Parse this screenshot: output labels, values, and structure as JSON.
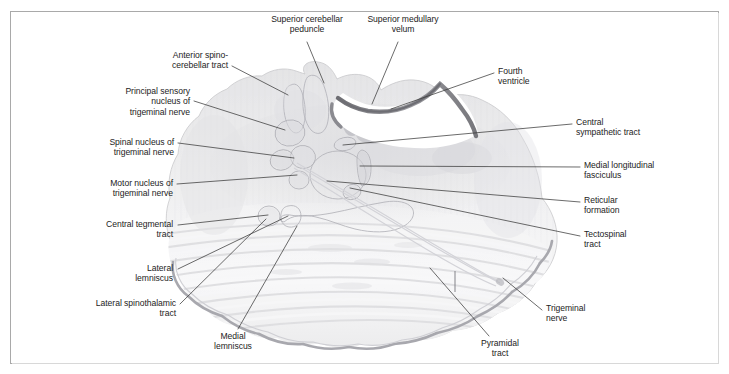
{
  "figure": {
    "frame_color": "#a9a9a9",
    "text_color": "#232323",
    "leader_color": "#3a3a3a",
    "tissue_fill": "#ededee",
    "tissue_stroke": "#c6c6c8",
    "ventricle_fill": "#ffffff",
    "velum_color": "#8e8e92"
  },
  "labels": [
    {
      "id": "superior-cerebellar-peduncle",
      "text": "Superior cerebellar\npeduncle",
      "align": "centered",
      "x": 248,
      "y": 14,
      "w": 118,
      "leader": [
        [
          307,
          42
        ],
        [
          324,
          83
        ]
      ]
    },
    {
      "id": "superior-medullary-velum",
      "text": "Superior medullary\nvelum",
      "align": "centered",
      "x": 345,
      "y": 14,
      "w": 116,
      "leader": [
        [
          398,
          42
        ],
        [
          372,
          104
        ]
      ]
    },
    {
      "id": "anterior-spinocerebellar-tract",
      "text": "Anterior spino-\ncerebellar tract",
      "align": "left-of-line",
      "x": 128,
      "y": 50,
      "w": 100,
      "leader": [
        [
          232,
          66
        ],
        [
          288,
          95
        ]
      ]
    },
    {
      "id": "fourth-ventricle",
      "text": "Fourth\nventricle",
      "align": "right-of-line",
      "x": 498,
      "y": 66,
      "w": 80,
      "leader": [
        [
          494,
          73
        ],
        [
          391,
          109
        ]
      ]
    },
    {
      "id": "principal-sensory-nucleus-of-trigeminal-nerve",
      "text": "Principal sensory\nnucleus of\ntrigeminal nerve",
      "align": "left-of-line",
      "x": 86,
      "y": 86,
      "w": 104,
      "leader": [
        [
          194,
          101
        ],
        [
          285,
          130
        ]
      ]
    },
    {
      "id": "central-sympathetic-tract",
      "text": "Central\nsympathetic tract",
      "align": "right-of-line",
      "x": 576,
      "y": 117,
      "w": 104,
      "leader": [
        [
          572,
          124
        ],
        [
          343,
          145
        ]
      ]
    },
    {
      "id": "spinal-nucleus-of-trigeminal-nerve",
      "text": "Spinal nucleus of\ntrigeminal nerve",
      "align": "left-of-line",
      "x": 66,
      "y": 137,
      "w": 108,
      "leader": [
        [
          178,
          143
        ],
        [
          294,
          158
        ]
      ]
    },
    {
      "id": "medial-longitudinal-fasciculus",
      "text": "Medial longitudinal\nfasciculus",
      "align": "right-of-line",
      "x": 584,
      "y": 160,
      "w": 120,
      "leader": [
        [
          580,
          167
        ],
        [
          360,
          166
        ]
      ]
    },
    {
      "id": "motor-nucleus-of-trigeminal-nerve",
      "text": "Motor nucleus of\ntrigeminal nerve",
      "align": "left-of-line",
      "x": 65,
      "y": 178,
      "w": 108,
      "leader": [
        [
          177,
          184
        ],
        [
          297,
          175
        ]
      ]
    },
    {
      "id": "reticular-formation",
      "text": "Reticular\nformation",
      "align": "right-of-line",
      "x": 584,
      "y": 195,
      "w": 84,
      "leader": [
        [
          580,
          202
        ],
        [
          327,
          181
        ]
      ]
    },
    {
      "id": "central-tegmental-tract",
      "text": "Central tegmental\ntract",
      "align": "left-of-line",
      "x": 61,
      "y": 219,
      "w": 112,
      "leader": [
        [
          178,
          225
        ],
        [
          268,
          215
        ]
      ]
    },
    {
      "id": "tectospinal-tract",
      "text": "Tectospinal\ntract",
      "align": "right-of-line",
      "x": 584,
      "y": 229,
      "w": 88,
      "leader": [
        [
          580,
          236
        ],
        [
          350,
          188
        ]
      ]
    },
    {
      "id": "lateral-lemniscus",
      "text": "Lateral\nlemniscus",
      "align": "left-of-line",
      "x": 97,
      "y": 263,
      "w": 76,
      "leader": [
        [
          178,
          269
        ],
        [
          288,
          216
        ]
      ]
    },
    {
      "id": "trigeminal-nerve",
      "text": "Trigeminal\nnerve",
      "align": "right-of-line",
      "x": 546,
      "y": 303,
      "w": 84,
      "leader": [
        [
          542,
          310
        ],
        [
          503,
          278
        ]
      ]
    },
    {
      "id": "lateral-spinothalamic-tract",
      "text": "Lateral spinothalamic\ntract",
      "align": "left-of-line",
      "x": 44,
      "y": 298,
      "w": 132,
      "leader": [
        [
          180,
          304
        ],
        [
          266,
          219
        ]
      ]
    },
    {
      "id": "medial-lemniscus",
      "text": "Medial\nlemniscus",
      "align": "centered",
      "x": 195,
      "y": 331,
      "w": 76,
      "leader": [
        [
          238,
          329
        ],
        [
          297,
          226
        ]
      ]
    },
    {
      "id": "pyramidal-tract",
      "text": "Pyramidal\ntract",
      "align": "centered",
      "x": 460,
      "y": 338,
      "w": 80,
      "leader": [
        [
          489,
          336
        ],
        [
          430,
          268
        ]
      ]
    }
  ],
  "structures": [
    {
      "id": "fourth-ventricle-cavity",
      "name": "fourth ventricle"
    },
    {
      "id": "superior-medullary-velum-arc",
      "name": "superior medullary velum"
    },
    {
      "id": "superior-cerebellar-peduncle-left",
      "name": "superior cerebellar peduncle (left)"
    },
    {
      "id": "anterior-spinocerebellar-tract-outline",
      "name": "anterior spinocerebellar tract"
    },
    {
      "id": "principal-sensory-nucleus-outline",
      "name": "principal sensory nucleus of trigeminal nerve"
    },
    {
      "id": "spinal-nucleus-outline",
      "name": "spinal nucleus of trigeminal nerve"
    },
    {
      "id": "motor-nucleus-outline",
      "name": "motor nucleus of trigeminal nerve"
    },
    {
      "id": "reticular-formation-outline",
      "name": "reticular formation"
    },
    {
      "id": "medial-longitudinal-fasciculus-outline",
      "name": "medial longitudinal fasciculus"
    },
    {
      "id": "central-sympathetic-tract-outline",
      "name": "central sympathetic tract"
    },
    {
      "id": "tectospinal-tract-outline",
      "name": "tectospinal tract"
    },
    {
      "id": "central-tegmental-tract-outline",
      "name": "central tegmental tract"
    },
    {
      "id": "lateral-lemniscus-outline",
      "name": "lateral lemniscus"
    },
    {
      "id": "medial-lemniscus-outline",
      "name": "medial lemniscus"
    },
    {
      "id": "basilar-pons",
      "name": "basilar pons with transverse pontine fibers"
    },
    {
      "id": "trigeminal-nerve-root",
      "name": "trigeminal nerve root"
    }
  ]
}
